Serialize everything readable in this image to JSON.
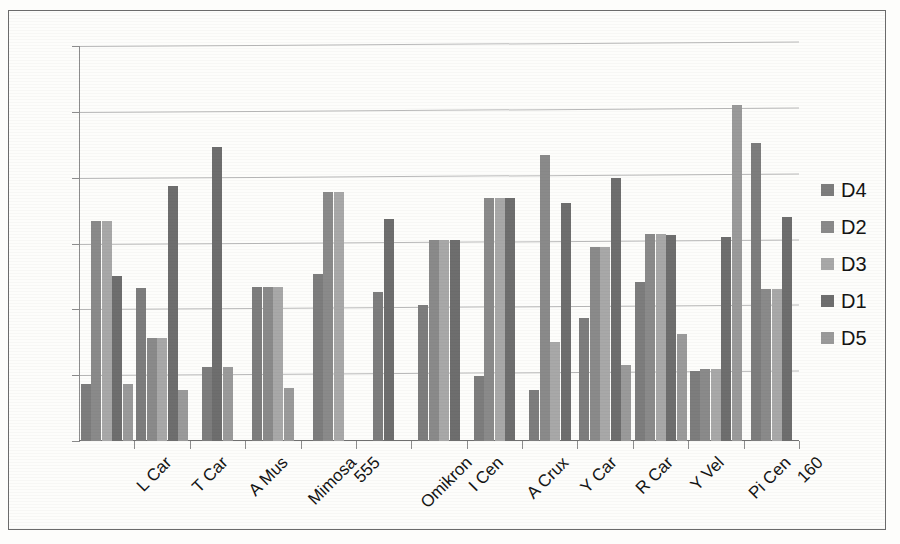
{
  "chart_data": {
    "type": "bar",
    "title": "",
    "xlabel": "",
    "ylabel": "",
    "ylim": [
      0,
      0.6
    ],
    "ytick_labels": [
      "0.6",
      "0.5",
      "0.4",
      "0.3",
      "0.2",
      "0.1",
      "0"
    ],
    "ytick_values": [
      0.6,
      0.5,
      0.4,
      0.3,
      0.2,
      0.1,
      0
    ],
    "grid": true,
    "legend_position": "right",
    "categories": [
      "L Car",
      "T Car",
      "A Mus",
      "Mimosa",
      "555",
      "Omikron",
      "I Cen",
      "A Crux",
      "Y Car",
      "R Car",
      "Y Vel",
      "Pi Cen",
      "160"
    ],
    "series": [
      {
        "name": "D4",
        "color": "#7d7d7d",
        "values": [
          0.086,
          0.233,
          0.113,
          0.234,
          0.253,
          0.227,
          0.206,
          0.099,
          0.078,
          0.187,
          0.241,
          0.107,
          0.453
        ]
      },
      {
        "name": "D2",
        "color": "#8a8a8a",
        "values": [
          0.334,
          0.157,
          null,
          0.234,
          0.378,
          null,
          0.305,
          0.369,
          0.435,
          0.294,
          0.315,
          0.109,
          0.231
        ]
      },
      {
        "name": "D3",
        "color": "#a8a8a8",
        "values": [
          0.334,
          0.157,
          null,
          0.234,
          0.378,
          null,
          0.305,
          0.369,
          0.15,
          0.294,
          0.315,
          0.109,
          0.231
        ]
      },
      {
        "name": "D1",
        "color": "#6e6e6e",
        "values": [
          0.251,
          0.387,
          0.446,
          null,
          null,
          0.337,
          0.305,
          0.369,
          0.362,
          0.4,
          0.313,
          0.31,
          0.341
        ]
      },
      {
        "name": "D5",
        "color": "#9a9a9a",
        "values": [
          0.086,
          0.078,
          0.113,
          0.08,
          null,
          null,
          null,
          null,
          null,
          0.115,
          0.162,
          0.51,
          null
        ]
      }
    ]
  },
  "legend": {
    "entries": [
      {
        "label": "D4",
        "color": "#7d7d7d"
      },
      {
        "label": "D2",
        "color": "#8a8a8a"
      },
      {
        "label": "D3",
        "color": "#a8a8a8"
      },
      {
        "label": "D1",
        "color": "#6e6e6e"
      },
      {
        "label": "D5",
        "color": "#9a9a9a"
      }
    ]
  }
}
